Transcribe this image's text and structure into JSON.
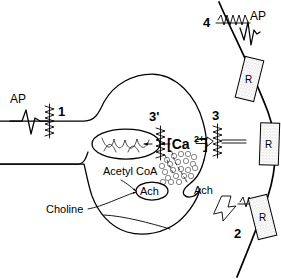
{
  "figure": {
    "kind": "neuroscience-schematic",
    "background_color": "#ffffff",
    "ink_color": "#000000"
  },
  "labels": {
    "ap_presynaptic": "AP",
    "ap_postsynaptic": "AP",
    "step_1": "1",
    "step_2": "2",
    "step_3": "3",
    "step_3_prime": "3'",
    "step_4": "4",
    "calcium": "[Ca",
    "calcium_superscript": "2+",
    "calcium_close": "]",
    "calcium_full": "[Ca2+]",
    "acetyl_coa": "Acetyl  CoA",
    "ach_vesicle_pool": "Ach",
    "ach_release": "Ach",
    "choline": "Choline",
    "receptor_1": "R",
    "receptor_2": "R",
    "receptor_3": "R"
  },
  "structures": {
    "axon": "presynaptic axon",
    "terminal": "presynaptic terminal bouton",
    "mitochondrion": "mitochondrion",
    "vesicles": "synaptic vesicles",
    "cleft": "synaptic cleft",
    "postsynaptic_membrane": "postsynaptic membrane",
    "calcium_channel": "voltage-gated calcium channel",
    "sodium_channel": "voltage-gated sodium channel",
    "receptor": "acetylcholine receptor"
  },
  "vesicle_points": [
    [
      167,
      160
    ],
    [
      173,
      157
    ],
    [
      180,
      155
    ],
    [
      186,
      154
    ],
    [
      192,
      156
    ],
    [
      163,
      166
    ],
    [
      170,
      164
    ],
    [
      177,
      162
    ],
    [
      184,
      161
    ],
    [
      190,
      163
    ],
    [
      166,
      172
    ],
    [
      173,
      170
    ],
    [
      180,
      169
    ],
    [
      187,
      170
    ],
    [
      193,
      167
    ],
    [
      169,
      177
    ],
    [
      176,
      176
    ],
    [
      183,
      175
    ],
    [
      190,
      175
    ],
    [
      164,
      182
    ],
    [
      172,
      181
    ],
    [
      179,
      181
    ]
  ]
}
